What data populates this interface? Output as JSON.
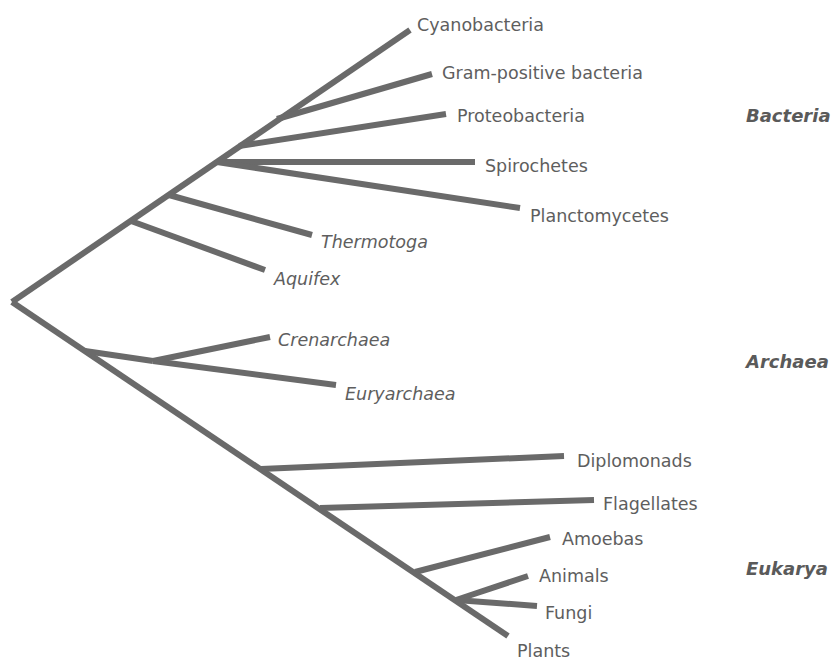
{
  "diagram": {
    "type": "phylogenetic-tree",
    "line_color": "#6a6a6a",
    "text_color": "#5e5e5e",
    "domains": [
      {
        "label": "Bacteria",
        "x": 746,
        "y": 117
      },
      {
        "label": "Archaea",
        "x": 746,
        "y": 363
      },
      {
        "label": "Eukarya",
        "x": 746,
        "y": 570
      }
    ],
    "leaves": [
      {
        "label": "Cyanobacteria",
        "italic": false,
        "x": 417,
        "y": 26
      },
      {
        "label": "Gram-positive bacteria",
        "italic": false,
        "x": 442,
        "y": 74
      },
      {
        "label": "Proteobacteria",
        "italic": false,
        "x": 457,
        "y": 117
      },
      {
        "label": "Spirochetes",
        "italic": false,
        "x": 485,
        "y": 167
      },
      {
        "label": "Planctomycetes",
        "italic": false,
        "x": 530,
        "y": 217
      },
      {
        "label": "Thermotoga",
        "italic": true,
        "x": 321,
        "y": 243
      },
      {
        "label": "Aquifex",
        "italic": true,
        "x": 274,
        "y": 280
      },
      {
        "label": "Crenarchaea",
        "italic": true,
        "x": 278,
        "y": 341
      },
      {
        "label": "Euryarchaea",
        "italic": true,
        "x": 345,
        "y": 395
      },
      {
        "label": "Diplomonads",
        "italic": false,
        "x": 577,
        "y": 462
      },
      {
        "label": "Flagellates",
        "italic": false,
        "x": 603,
        "y": 505
      },
      {
        "label": "Amoebas",
        "italic": false,
        "x": 562,
        "y": 540
      },
      {
        "label": "Animals",
        "italic": false,
        "x": 539,
        "y": 577
      },
      {
        "label": "Fungi",
        "italic": false,
        "x": 545,
        "y": 614
      },
      {
        "label": "Plants",
        "italic": false,
        "x": 517,
        "y": 652
      }
    ],
    "branches": [
      {
        "name": "root-to-bacteria",
        "x1": 12,
        "y1": 302,
        "x2": 410,
        "y2": 30
      },
      {
        "name": "gram-positive",
        "x1": 277,
        "y1": 119,
        "x2": 432,
        "y2": 74
      },
      {
        "name": "proteobacteria",
        "x1": 239,
        "y1": 146,
        "x2": 446,
        "y2": 114
      },
      {
        "name": "spirochetes",
        "x1": 217,
        "y1": 162,
        "x2": 475,
        "y2": 162
      },
      {
        "name": "planctomycetes",
        "x1": 217,
        "y1": 162,
        "x2": 520,
        "y2": 208
      },
      {
        "name": "thermotoga",
        "x1": 169,
        "y1": 195,
        "x2": 312,
        "y2": 235
      },
      {
        "name": "aquifex",
        "x1": 131,
        "y1": 221,
        "x2": 265,
        "y2": 270
      },
      {
        "name": "root-to-eukarya",
        "x1": 12,
        "y1": 302,
        "x2": 508,
        "y2": 636
      },
      {
        "name": "archaea-stem",
        "x1": 85,
        "y1": 351,
        "x2": 153,
        "y2": 361
      },
      {
        "name": "crenarchaea",
        "x1": 153,
        "y1": 361,
        "x2": 270,
        "y2": 337
      },
      {
        "name": "euryarchaea",
        "x1": 153,
        "y1": 361,
        "x2": 336,
        "y2": 385
      },
      {
        "name": "diplomonads",
        "x1": 261,
        "y1": 469,
        "x2": 564,
        "y2": 456
      },
      {
        "name": "flagellates",
        "x1": 320,
        "y1": 508,
        "x2": 594,
        "y2": 500
      },
      {
        "name": "amoebas",
        "x1": 415,
        "y1": 572,
        "x2": 550,
        "y2": 537
      },
      {
        "name": "animals",
        "x1": 456,
        "y1": 600,
        "x2": 528,
        "y2": 576
      },
      {
        "name": "fungi",
        "x1": 456,
        "y1": 600,
        "x2": 537,
        "y2": 606
      }
    ]
  }
}
